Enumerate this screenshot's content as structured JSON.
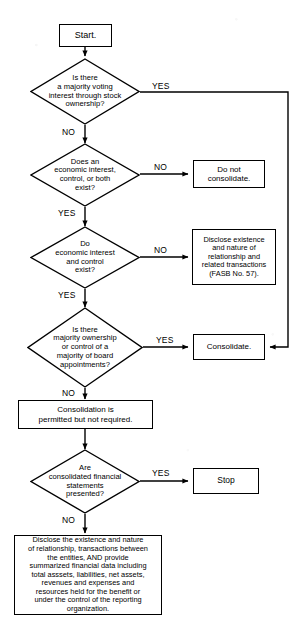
{
  "diagram": {
    "type": "flowchart",
    "stroke_color": "#000000",
    "background_color": "#ffffff"
  },
  "nodes": {
    "start": {
      "label": "Start.",
      "shape": "rectangle"
    },
    "d1": {
      "label": "Is there\na majority voting\ninterest through stock\nownership?",
      "shape": "diamond"
    },
    "d2": {
      "label": "Does an\neconomic interest,\ncontrol, or both\nexist?",
      "shape": "diamond"
    },
    "d3": {
      "label": "Do\neconomic interest\nand control\nexist?",
      "shape": "diamond"
    },
    "d4": {
      "label": "Is there\nmajority ownership\nor control of a\nmajority of board\nappointments?",
      "shape": "diamond"
    },
    "d5": {
      "label": "Are\nconsolidated financial\nstatements\npresented?",
      "shape": "diamond"
    },
    "do_not_consolidate": {
      "label": "Do not\nconsolidate.",
      "shape": "rectangle"
    },
    "disclose_fasb": {
      "label": "Disclose existence\nand nature of\nrelationship and\nrelated transactions\n(FASB No. 57).",
      "shape": "rectangle"
    },
    "consolidate": {
      "label": "Consolidate.",
      "shape": "rectangle"
    },
    "permitted": {
      "label": "Consolidation is\npermitted but not required.",
      "shape": "rectangle"
    },
    "stop": {
      "label": "Stop",
      "shape": "rectangle"
    },
    "disclose_full": {
      "label": "Disclose the existence and nature\nof relationship, transactions between\nthe entities, AND provide\nsummarized financial data including\ntotal asssets, liabilities, net assets,\nrevenues and expenses and\nresources held for the benefit or\nunder the control of the reporting\norganization.",
      "shape": "rectangle"
    }
  },
  "edge_labels": {
    "d1_yes": "YES",
    "d1_no": "NO",
    "d2_no": "NO",
    "d2_yes": "YES",
    "d3_no": "NO",
    "d3_yes": "YES",
    "d4_yes": "YES",
    "d4_no": "NO",
    "d5_yes": "YES",
    "d5_no": "NO"
  }
}
